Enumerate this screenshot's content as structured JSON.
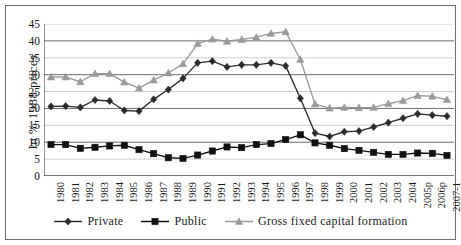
{
  "chart_data": {
    "type": "line",
    "title": "",
    "xlabel": "",
    "ylabel": "In % 1988 prices",
    "ylim": [
      0,
      45
    ],
    "ytick_step": 5,
    "yticks": [
      45,
      40,
      35,
      30,
      25,
      20,
      15,
      10,
      5,
      0
    ],
    "grid": true,
    "legend_position": "bottom",
    "categories": [
      "1980",
      "1981",
      "1982",
      "1983",
      "1984",
      "1985",
      "1986",
      "1987",
      "1988",
      "1989",
      "1990",
      "1991",
      "1992",
      "1993",
      "1994",
      "1995",
      "1996",
      "1997",
      "1998",
      "1999",
      "2000",
      "2001",
      "2002",
      "2003",
      "2004",
      "2005p",
      "2006p",
      "2007-1"
    ],
    "series": [
      {
        "name": "Private",
        "marker": "diamond",
        "color": "#2b2b2b",
        "values": [
          20.6,
          20.7,
          20.3,
          22.5,
          22.2,
          19.4,
          19.2,
          22.7,
          25.6,
          28.9,
          33.5,
          34.0,
          32.3,
          32.9,
          32.9,
          33.5,
          32.6,
          23.0,
          12.7,
          11.7,
          13.1,
          13.3,
          14.5,
          15.8,
          17.1,
          18.4,
          18.0,
          17.7
        ]
      },
      {
        "name": "Public",
        "marker": "square",
        "color": "#111111",
        "values": [
          9.3,
          9.3,
          8.2,
          8.5,
          8.9,
          9.1,
          7.8,
          6.6,
          5.4,
          5.2,
          6.2,
          7.4,
          8.6,
          8.4,
          9.3,
          9.6,
          10.8,
          12.2,
          9.8,
          9.1,
          8.1,
          7.6,
          7.0,
          6.4,
          6.4,
          6.8,
          6.7,
          6.1
        ]
      },
      {
        "name": "Gross fixed capital formation",
        "marker": "triangle",
        "color": "#9a9a9a",
        "values": [
          29.3,
          29.3,
          27.9,
          30.3,
          30.3,
          27.8,
          26.0,
          28.4,
          30.5,
          33.2,
          39.2,
          40.5,
          39.9,
          40.4,
          41.1,
          42.2,
          42.7,
          34.5,
          21.3,
          20.1,
          20.3,
          20.2,
          20.3,
          21.4,
          22.3,
          23.8,
          23.6,
          22.6
        ]
      }
    ]
  },
  "legend": {
    "items": [
      {
        "label": "Private"
      },
      {
        "label": "Public"
      },
      {
        "label": "Gross fixed capital formation"
      }
    ]
  }
}
